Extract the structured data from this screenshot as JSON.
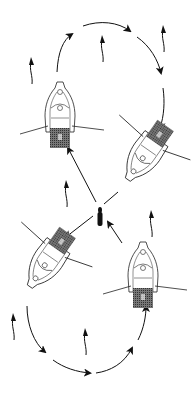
{
  "diagram": {
    "colors": {
      "background": "#ffffff",
      "ink": "#111111",
      "shading": "#555555"
    },
    "boats": [
      {
        "id": "boat-top-left",
        "x": 60,
        "y": 110,
        "rotation": 0
      },
      {
        "id": "boat-right",
        "x": 145,
        "y": 150,
        "rotation": 215
      },
      {
        "id": "boat-bottom-left",
        "x": 50,
        "y": 265,
        "rotation": 215
      },
      {
        "id": "boat-bottom-right",
        "x": 142,
        "y": 272,
        "rotation": 0
      }
    ],
    "center_figure": {
      "x": 100,
      "y": 213,
      "label": "angler"
    },
    "drift_arrows_count": 7,
    "path_arrows_count": 2
  }
}
